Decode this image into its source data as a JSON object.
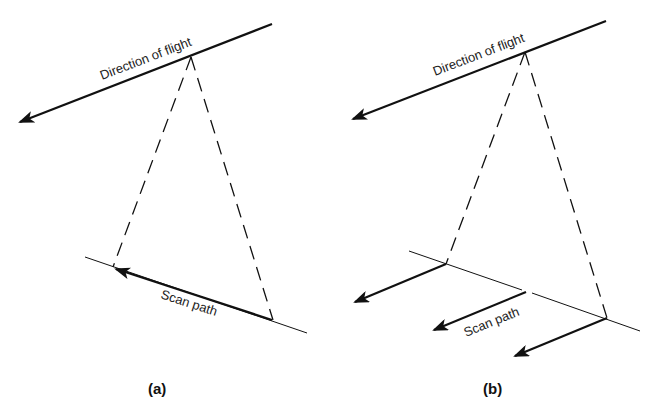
{
  "panels": [
    {
      "id": "a",
      "caption": "(a)",
      "flight_label": "Direction of flight",
      "scan_label": "Scan path",
      "description": "Single scan line swept across track by one detector"
    },
    {
      "id": "b",
      "caption": "(b)",
      "flight_label": "Direction of flight",
      "scan_label": "Scan path",
      "description": "Push-broom: detector array moving along-track"
    }
  ],
  "colors": {
    "line": "#111111",
    "text": "#222222",
    "background": "#ffffff"
  }
}
